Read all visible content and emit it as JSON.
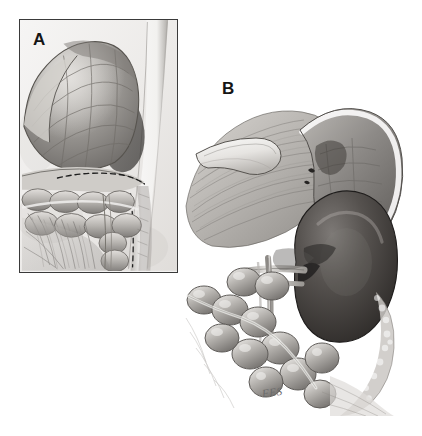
{
  "figure": {
    "kind": "medical-illustration",
    "style": "graphite pencil and wash, grayscale",
    "background_color": "#ffffff",
    "width": 422,
    "height": 436,
    "signature": "FES"
  },
  "panels": [
    {
      "id": "A",
      "label": "A",
      "framed": true,
      "frame_color": "#3a3a3a",
      "bounds": {
        "x": 19,
        "y": 19,
        "width": 159,
        "height": 254
      },
      "description": "Sagittal surgical exposure: stomach with greater curvature above, segmented bowel loops and mesentery below, dashed incision line across the midfield, pale vertical vessel band at the right margin.",
      "structures": [
        {
          "name": "stomach",
          "tone": "#9a9794"
        },
        {
          "name": "greater-curvature-fold",
          "tone": "#b4b1ad"
        },
        {
          "name": "bowel-loops",
          "tone": "#c2bfbb"
        },
        {
          "name": "mesentery-fan",
          "tone": "#a8a5a1"
        },
        {
          "name": "dashed-incision-line",
          "tone": "#2e2e2e"
        },
        {
          "name": "vessel-band",
          "tone": "#f0efed"
        }
      ]
    },
    {
      "id": "B",
      "label": "B",
      "framed": false,
      "bounds": {
        "x": 180,
        "y": 86,
        "width": 230,
        "height": 330
      },
      "description": "Retroperitoneal exposure: fibrous fatty tissue with a retracted peritoneal flap at upper left, a curved organ with bright highlighted rim at upper right, dark bean-shaped kidney at center right, chained colon loops across the lower left, vessels crossing the renal hilum.",
      "structures": [
        {
          "name": "fibrous-fatty-tissue",
          "tone": "#b9b6b2"
        },
        {
          "name": "retracted-peritoneal-flap",
          "tone": "#e3e1de"
        },
        {
          "name": "curved-organ",
          "tone": "#8e8b88"
        },
        {
          "name": "organ-highlight-rim",
          "tone": "#efeeec"
        },
        {
          "name": "kidney",
          "tone": "#4b4745"
        },
        {
          "name": "renal-vessels",
          "tone": "#d8d5d1"
        },
        {
          "name": "ureter",
          "tone": "#cfccc8"
        },
        {
          "name": "colon-loops",
          "tone": "#b0adaa"
        },
        {
          "name": "fat-fringe",
          "tone": "#c8c5c1"
        }
      ]
    }
  ],
  "colors": {
    "ink_dark": "#2e2e2e",
    "ink_mid": "#6e6b68",
    "wash_light": "#dcdad7",
    "wash_mid": "#a8a5a1",
    "wash_dark": "#4b4745",
    "paper": "#f3f2f1"
  }
}
